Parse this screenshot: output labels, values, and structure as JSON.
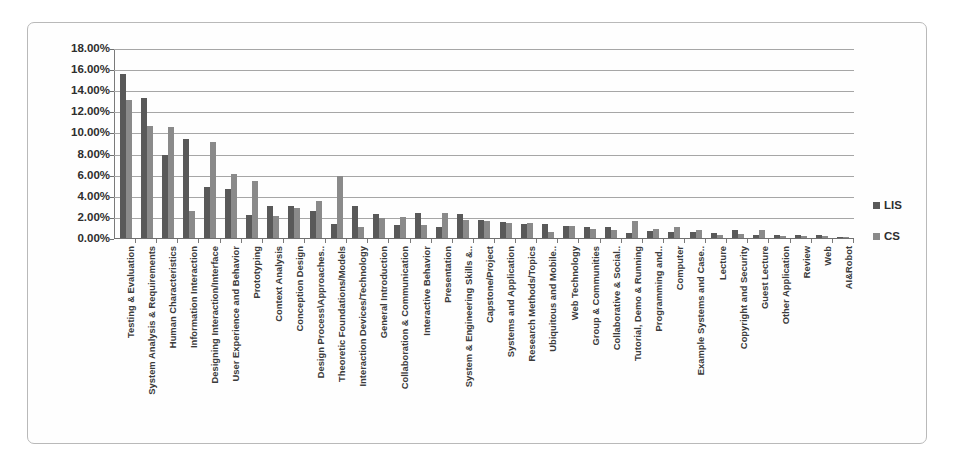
{
  "chart_data": {
    "type": "bar",
    "title": "",
    "subtitle": "",
    "xlabel": "",
    "ylabel": "",
    "ylim": [
      0,
      18
    ],
    "y_unit": "%",
    "grid": true,
    "legend_position": "right",
    "y_ticks": [
      "0.00%",
      "2.00%",
      "4.00%",
      "6.00%",
      "8.00%",
      "10.00%",
      "12.00%",
      "14.00%",
      "16.00%",
      "18.00%"
    ],
    "y_tick_values": [
      0,
      2,
      4,
      6,
      8,
      10,
      12,
      14,
      16,
      18
    ],
    "categories": [
      "Testing & Evaluation",
      "System Analysis & Requirements",
      "Human Characteristics",
      "Information Interaction",
      "Designing Interaction/Interface",
      "User Experience and Behavior",
      "Prototyping",
      "Context Analysis",
      "Conception Design",
      "Design Process\\Approaches..",
      "Theoretic Foundations/Models",
      "Interaction Devices/Technology",
      "General Introduction",
      "Collaboration & Communication",
      "Interactive Behavior",
      "Presentation",
      "System & Engineering Skills &..",
      "Capstone/Project",
      "Systems and Application",
      "Research Methods/Topics",
      "Ubiquitous and Mobile..",
      "Web Technology",
      "Group & Communities",
      "Collaborative & Social..",
      "Tutorial, Demo & Running",
      "Programming and..",
      "Computer",
      "Example Systems and Case..",
      "Lecture",
      "Copyright and Security",
      "Guest Lecture",
      "Other Application",
      "Review",
      "Web",
      "AI&Robot"
    ],
    "series": [
      {
        "name": "LIS",
        "color": "#595959",
        "values": [
          15.5,
          13.3,
          7.9,
          9.4,
          4.8,
          4.6,
          2.2,
          3.0,
          3.0,
          2.6,
          1.3,
          3.0,
          2.3,
          1.2,
          2.4,
          1.0,
          2.3,
          1.7,
          1.5,
          1.3,
          1.3,
          1.1,
          1.0,
          1.0,
          0.5,
          0.7,
          0.6,
          0.6,
          0.5,
          0.8,
          0.3,
          0.3,
          0.3,
          0.3,
          0.1
        ]
      },
      {
        "name": "CS",
        "color": "#8a8a8a",
        "values": [
          13.1,
          10.6,
          10.5,
          2.6,
          9.1,
          6.1,
          5.4,
          2.1,
          2.8,
          3.5,
          5.9,
          1.0,
          1.9,
          2.0,
          1.2,
          2.4,
          1.7,
          1.6,
          1.4,
          1.4,
          0.6,
          1.1,
          0.9,
          0.8,
          1.6,
          0.9,
          1.0,
          0.8,
          0.3,
          0.4,
          0.8,
          0.2,
          0.2,
          0.2,
          0.1
        ]
      }
    ]
  },
  "legend": {
    "items": [
      {
        "label": "LIS",
        "color": "#595959"
      },
      {
        "label": "CS",
        "color": "#8a8a8a"
      }
    ]
  }
}
